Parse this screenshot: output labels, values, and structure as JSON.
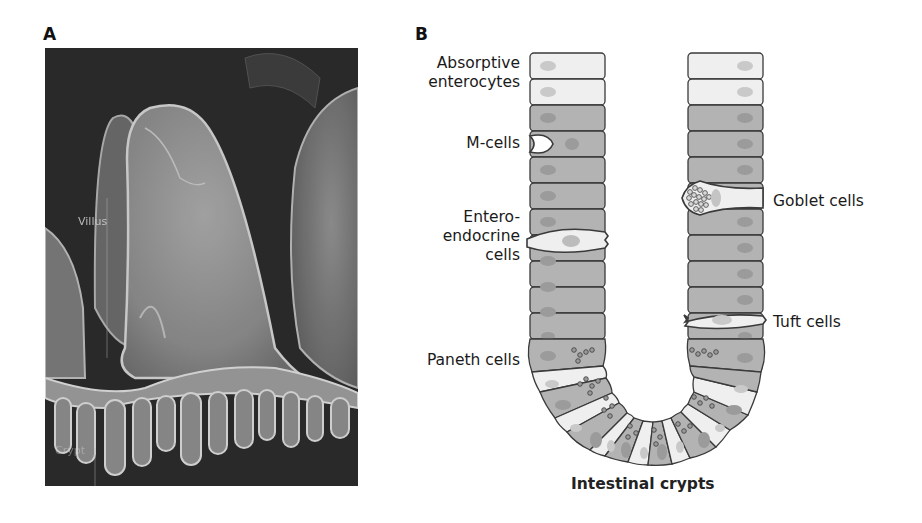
{
  "panels": {
    "a": {
      "letter": "A",
      "description": "Scanning electron micrograph of intestinal villi and crypts",
      "labels": {
        "villus": "Villus",
        "crypt": "Crypt"
      }
    },
    "b": {
      "letter": "B",
      "title": "Intestinal crypts",
      "left_labels": {
        "absorptive": [
          "Absorptive",
          "enterocytes"
        ],
        "m_cells": "M-cells",
        "enteroendocrine": [
          "Entero-",
          "endocrine",
          "cells"
        ],
        "paneth": "Paneth cells"
      },
      "right_labels": {
        "goblet": "Goblet cells",
        "tuft": "Tuft cells"
      }
    }
  },
  "colors": {
    "cell_dark": "#b3b3b3",
    "cell_light": "#efefef",
    "outline": "#3a3a3a",
    "nucleus": "#8f8f8f",
    "nucleus_light": "#c9c9c9"
  }
}
